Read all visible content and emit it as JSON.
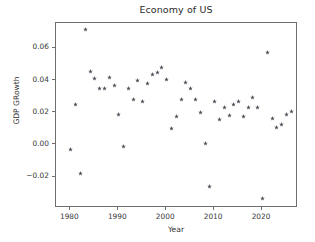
{
  "chart_data": {
    "type": "scatter",
    "title": "Economy of US",
    "xlabel": "Year",
    "ylabel": "GDP GRowth",
    "xlim": [
      1977.5,
      1977.5
    ],
    "x_range": [
      1977.0,
      1028.0
    ],
    "axis": {
      "xlim": [
        1977.0,
        2027.5
      ],
      "ylim": [
        -0.0395,
        0.0755
      ],
      "grid": false,
      "legend": null,
      "marker": "star",
      "marker_color": "#4a4a55"
    },
    "xticks": [
      1980,
      1990,
      2000,
      2010,
      2020
    ],
    "xtick_labels": [
      "1980",
      "1990",
      "2000",
      "2010",
      "2020"
    ],
    "yticks": [
      -0.02,
      0.0,
      0.02,
      0.04,
      0.06
    ],
    "ytick_labels": [
      "−0.02",
      "0.00",
      "0.02",
      "0.04",
      "0.06"
    ],
    "x": [
      1980,
      1981,
      1982,
      1983,
      1984,
      1985,
      1986,
      1987,
      1988,
      1989,
      1990,
      1991,
      1992,
      1993,
      1994,
      1995,
      1996,
      1997,
      1998,
      1999,
      2000,
      2001,
      2002,
      2003,
      2004,
      2005,
      2006,
      2007,
      2008,
      2009,
      2010,
      2011,
      2012,
      2013,
      2014,
      2015,
      2016,
      2017,
      2018,
      2019,
      2020,
      2021,
      2022,
      2023,
      2024,
      2025,
      2026
    ],
    "y": [
      -0.003,
      0.0249,
      -0.0177,
      0.0718,
      0.0459,
      0.0416,
      0.0349,
      0.0349,
      0.0417,
      0.0371,
      0.019,
      -0.0007,
      0.0349,
      0.0283,
      0.0403,
      0.0268,
      0.0379,
      0.0438,
      0.0448,
      0.0479,
      0.0409,
      0.0102,
      0.0174,
      0.0283,
      0.0388,
      0.0352,
      0.0282,
      0.0201,
      0.0012,
      -0.0259,
      0.0268,
      0.0161,
      0.0231,
      0.0184,
      0.0251,
      0.0268,
      0.0174,
      0.0235,
      0.0296,
      0.0235,
      -0.0334,
      0.0574,
      0.0163,
      0.0106,
      0.0125,
      0.0192,
      0.0211
    ],
    "points": [
      {
        "year": 1980,
        "value": -0.003
      },
      {
        "year": 1981,
        "value": 0.0249
      },
      {
        "year": 1982,
        "value": -0.0177
      },
      {
        "year": 1983,
        "value": 0.0718
      },
      {
        "year": 1984,
        "value": 0.0459
      },
      {
        "year": 1985,
        "value": 0.0416
      },
      {
        "year": 1986,
        "value": 0.0349
      },
      {
        "year": 1987,
        "value": 0.0349
      },
      {
        "year": 1988,
        "value": 0.0417
      },
      {
        "year": 1989,
        "value": 0.0371
      },
      {
        "year": 1990,
        "value": 0.019
      },
      {
        "year": 1991,
        "value": -0.0007
      },
      {
        "year": 1992,
        "value": 0.0349
      },
      {
        "year": 1993,
        "value": 0.0283
      },
      {
        "year": 1994,
        "value": 0.0403
      },
      {
        "year": 1995,
        "value": 0.0268
      },
      {
        "year": 1996,
        "value": 0.0379
      },
      {
        "year": 1997,
        "value": 0.0438
      },
      {
        "year": 1998,
        "value": 0.0448
      },
      {
        "year": 1999,
        "value": 0.0479
      },
      {
        "year": 2000,
        "value": 0.0409
      },
      {
        "year": 2001,
        "value": 0.0102
      },
      {
        "year": 2002,
        "value": 0.0174
      },
      {
        "year": 2003,
        "value": 0.0283
      },
      {
        "year": 2004,
        "value": 0.0388
      },
      {
        "year": 2005,
        "value": 0.0352
      },
      {
        "year": 2006,
        "value": 0.0282
      },
      {
        "year": 2007,
        "value": 0.0201
      },
      {
        "year": 2008,
        "value": 0.0012
      },
      {
        "year": 2009,
        "value": -0.0259
      },
      {
        "year": 2010,
        "value": 0.0268
      },
      {
        "year": 2011,
        "value": 0.0161
      },
      {
        "year": 2012,
        "value": 0.0231
      },
      {
        "year": 2013,
        "value": 0.0184
      },
      {
        "year": 2014,
        "value": 0.0251
      },
      {
        "year": 2015,
        "value": 0.0268
      },
      {
        "year": 2016,
        "value": 0.0174
      },
      {
        "year": 2017,
        "value": 0.0235
      },
      {
        "year": 2018,
        "value": 0.0296
      },
      {
        "year": 2019,
        "value": 0.0235
      },
      {
        "year": 2020,
        "value": -0.0334
      },
      {
        "year": 2021,
        "value": 0.0574
      },
      {
        "year": 2022,
        "value": 0.0163
      },
      {
        "year": 2023,
        "value": 0.0106
      },
      {
        "year": 2024,
        "value": 0.0125
      },
      {
        "year": 2025,
        "value": 0.0192
      },
      {
        "year": 2026,
        "value": 0.0211
      }
    ]
  }
}
